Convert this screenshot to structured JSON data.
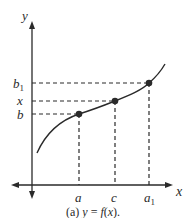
{
  "diagram": {
    "axes": {
      "x_label": "x",
      "y_label": "y"
    },
    "x_ticks": [
      {
        "label": "a",
        "sub": ""
      },
      {
        "label": "c",
        "sub": ""
      },
      {
        "label": "a",
        "sub": "1"
      }
    ],
    "y_ticks": [
      {
        "label": "b",
        "sub": "1"
      },
      {
        "label": "x",
        "sub": ""
      },
      {
        "label": "b",
        "sub": ""
      }
    ],
    "points": [
      {
        "x": "a",
        "y": "b"
      },
      {
        "x": "c",
        "y": "x"
      },
      {
        "x": "a1",
        "y": "b1"
      }
    ],
    "caption_prefix": "(a) ",
    "caption_italic": "y",
    "caption_mid": " = ",
    "caption_fn": "f",
    "caption_paren_open": "(",
    "caption_arg": "x",
    "caption_end": ")."
  }
}
